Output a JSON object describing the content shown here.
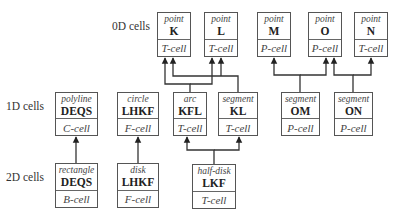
{
  "row_labels": [
    {
      "id": "0d",
      "text": "0D cells",
      "x": 112,
      "y": 28
    },
    {
      "id": "1d",
      "text": "1D cells",
      "x": 6,
      "y": 108
    },
    {
      "id": "2d",
      "text": "2D cells",
      "x": 6,
      "y": 179
    }
  ],
  "cells": [
    {
      "id": "K",
      "kind": "point",
      "name": "K",
      "type": "T-cell",
      "x": 157,
      "y": 12,
      "w": 34,
      "h": 45
    },
    {
      "id": "L",
      "kind": "point",
      "name": "L",
      "type": "T-cell",
      "x": 204,
      "y": 12,
      "w": 34,
      "h": 45
    },
    {
      "id": "M",
      "kind": "point",
      "name": "M",
      "type": "P-cell",
      "x": 257,
      "y": 12,
      "w": 34,
      "h": 45
    },
    {
      "id": "O",
      "kind": "point",
      "name": "O",
      "type": "P-cell",
      "x": 308,
      "y": 12,
      "w": 34,
      "h": 45
    },
    {
      "id": "N",
      "kind": "point",
      "name": "N",
      "type": "T-cell",
      "x": 354,
      "y": 12,
      "w": 34,
      "h": 45
    },
    {
      "id": "DEQS1",
      "kind": "polyline",
      "name": "DEQS",
      "type": "C-cell",
      "x": 55,
      "y": 92,
      "w": 43,
      "h": 44
    },
    {
      "id": "LHKF1",
      "kind": "circle",
      "name": "LHKF",
      "type": "F-cell",
      "x": 117,
      "y": 92,
      "w": 42,
      "h": 44
    },
    {
      "id": "KFL",
      "kind": "arc",
      "name": "KFL",
      "type": "T-cell",
      "x": 173,
      "y": 92,
      "w": 34,
      "h": 44
    },
    {
      "id": "KL",
      "kind": "segment",
      "name": "KL",
      "type": "T-cell",
      "x": 218,
      "y": 92,
      "w": 40,
      "h": 44
    },
    {
      "id": "OM",
      "kind": "segment",
      "name": "OM",
      "type": "P-cell",
      "x": 281,
      "y": 92,
      "w": 39,
      "h": 44
    },
    {
      "id": "ON",
      "kind": "segment",
      "name": "ON",
      "type": "P-cell",
      "x": 334,
      "y": 92,
      "w": 39,
      "h": 44
    },
    {
      "id": "DEQS2",
      "kind": "rectangle",
      "name": "DEQS",
      "type": "B-cell",
      "x": 55,
      "y": 163,
      "w": 43,
      "h": 45
    },
    {
      "id": "LHKF2",
      "kind": "disk",
      "name": "LHKF",
      "type": "F-cell",
      "x": 117,
      "y": 163,
      "w": 42,
      "h": 45
    },
    {
      "id": "LKF",
      "kind": "half-disk",
      "name": "LKF",
      "type": "T-cell",
      "x": 192,
      "y": 164,
      "w": 44,
      "h": 45
    }
  ],
  "connectors": [
    {
      "from": "DEQS2",
      "to": "DEQS1",
      "path": "M76,163 L76,137"
    },
    {
      "from": "LHKF2",
      "to": "LHKF1",
      "path": "M138,163 L138,137"
    },
    {
      "from": "LKF",
      "to": "KFL",
      "path": "M214,164 L214,150 L187,150 L187,137"
    },
    {
      "from": "LKF",
      "to": "KL",
      "path": "M214,150 L239,150 L239,137"
    },
    {
      "from": "KFL",
      "to": "K",
      "path": "M190,92 L190,84 L165,84 L165,58"
    },
    {
      "from": "KFL",
      "to": "L",
      "path": "M190,84 L212,84 L212,58"
    },
    {
      "from": "KL",
      "to": "K",
      "path": "M238,92 L238,76 L173,76 L173,58"
    },
    {
      "from": "KL",
      "to": "L",
      "path": "M221,76 L221,58"
    },
    {
      "from": "OM",
      "to": "M",
      "path": "M300,92 L300,75 L274,75 L274,58"
    },
    {
      "from": "OM",
      "to": "O",
      "path": "M300,75 L326,75 L326,58"
    },
    {
      "from": "ON",
      "to": "O",
      "path": "M353,92 L353,75 L334,75 L334,58"
    },
    {
      "from": "ON",
      "to": "N",
      "path": "M353,75 L371,75 L371,58"
    }
  ],
  "colors": {
    "line": "#333333",
    "border": "#555555"
  }
}
